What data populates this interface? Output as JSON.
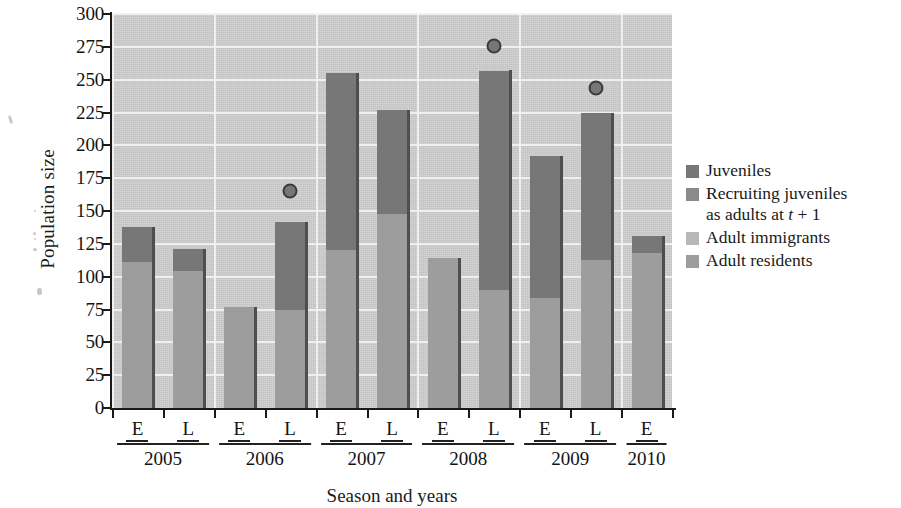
{
  "chart_data": {
    "type": "bar",
    "stacked": true,
    "title": "",
    "xlabel": "Season and years",
    "ylabel": "Population size",
    "ylim": [
      0,
      300
    ],
    "ytick_step": 25,
    "yticks": [
      0,
      25,
      50,
      75,
      100,
      125,
      150,
      175,
      200,
      225,
      250,
      275,
      300
    ],
    "grid": true,
    "legend_position": "right",
    "categories": [
      "2005 E",
      "2005 L",
      "2006 E",
      "2006 L",
      "2007 E",
      "2007 L",
      "2008 E",
      "2008 L",
      "2009 E",
      "2009 L",
      "2010 E"
    ],
    "seasons": [
      "E",
      "L",
      "E",
      "L",
      "E",
      "L",
      "E",
      "L",
      "E",
      "L",
      "E"
    ],
    "years": [
      {
        "label": "2005",
        "seasons": [
          "E",
          "L"
        ]
      },
      {
        "label": "2006",
        "seasons": [
          "E",
          "L"
        ]
      },
      {
        "label": "2007",
        "seasons": [
          "E",
          "L"
        ]
      },
      {
        "label": "2008",
        "seasons": [
          "E",
          "L"
        ]
      },
      {
        "label": "2009",
        "seasons": [
          "E",
          "L"
        ]
      },
      {
        "label": "2010",
        "seasons": [
          "E"
        ]
      }
    ],
    "series": [
      {
        "name": "Adult residents",
        "key": "adult_residents",
        "color": "#9d9d9d",
        "values": [
          111,
          104,
          77,
          75,
          120,
          148,
          114,
          90,
          84,
          113,
          118
        ]
      },
      {
        "name": "Adult immigrants",
        "key": "adult_immigrants",
        "color": "#b7b7b7",
        "values": [
          0,
          0,
          0,
          0,
          0,
          0,
          0,
          0,
          0,
          0,
          0
        ]
      },
      {
        "name": "Recruiting juveniles as adults at t + 1",
        "key": "recruiting_juveniles",
        "color": "#8a8a8a",
        "values": [
          0,
          0,
          0,
          0,
          0,
          0,
          0,
          0,
          0,
          0,
          0
        ]
      },
      {
        "name": "Juveniles",
        "key": "juveniles",
        "color": "#777777",
        "values": [
          27,
          17,
          0,
          67,
          135,
          79,
          0,
          167,
          108,
          112,
          13
        ]
      }
    ],
    "totals": [
      138,
      121,
      77,
      142,
      255,
      227,
      114,
      257,
      192,
      225,
      131
    ],
    "markers": {
      "name": "observed point",
      "color": "#767676",
      "edge_color": "#3b3b3b",
      "points": [
        {
          "category": "2006 L",
          "value": 165
        },
        {
          "category": "2008 L",
          "value": 276
        },
        {
          "category": "2009 L",
          "value": 244
        }
      ]
    }
  },
  "legend": {
    "items": [
      {
        "label": "Juveniles",
        "color": "#777777",
        "italic_part": ""
      },
      {
        "label": "Recruiting juveniles",
        "label2": "as adults at ",
        "italic_part": "t",
        "label3": " + 1",
        "color": "#8a8a8a"
      },
      {
        "label": "Adult immigrants",
        "color": "#b7b7b7",
        "italic_part": ""
      },
      {
        "label": "Adult residents",
        "color": "#9d9d9d",
        "italic_part": ""
      }
    ]
  },
  "axes": {
    "y_title": "Population size",
    "x_title": "Season and years"
  },
  "colors": {
    "plot_background": "#cfcfcf",
    "gridline": "#f2f2f2",
    "axis": "#1a1a1a",
    "bar_shadow": "#4e4e4e",
    "text": "#131313"
  }
}
